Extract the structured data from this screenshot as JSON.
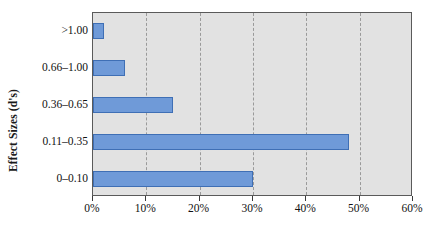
{
  "chart_data": {
    "type": "bar",
    "orientation": "horizontal",
    "title": "",
    "xlabel": "",
    "ylabel": "Effect Sizes (d's)",
    "categories": [
      ">1.00",
      "0.66–1.00",
      "0.36–0.65",
      "0.11–0.35",
      "0–0.10"
    ],
    "values": [
      2,
      6,
      15,
      48,
      30
    ],
    "value_labels": [
      "2%",
      "6%",
      "15%",
      "48%",
      "30%"
    ],
    "xlim": [
      0,
      60
    ],
    "xticks": [
      0,
      10,
      20,
      30,
      40,
      50,
      60
    ],
    "xtick_labels": [
      "0%",
      "10%",
      "20%",
      "30%",
      "40%",
      "50%",
      "60%"
    ],
    "grid": "vertical-dashed",
    "legend": "none",
    "colors": {
      "bar_fill": "#6F9AD8",
      "bar_border": "#3F6FB5",
      "plot_background": "#E2E2E2",
      "plot_border": "#5A5A5A",
      "gridline": "#9A9A9A",
      "text": "#111111"
    }
  }
}
